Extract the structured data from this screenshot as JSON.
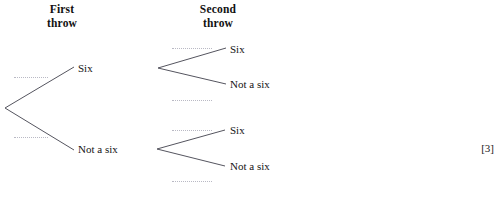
{
  "diagram": {
    "type": "probability-tree",
    "headers": [
      {
        "id": "first",
        "line1": "First",
        "line2": "throw"
      },
      {
        "id": "second",
        "line1": "Second",
        "line2": "throw"
      }
    ],
    "stage_one": {
      "outcomes": [
        {
          "label": "Six",
          "probability_blank": ""
        },
        {
          "label": "Not a six",
          "probability_blank": ""
        }
      ]
    },
    "stage_two": {
      "branch_from_six": {
        "outcomes": [
          {
            "label": "Six",
            "probability_blank": ""
          },
          {
            "label": "Not a six",
            "probability_blank": ""
          }
        ]
      },
      "branch_from_not_a_six": {
        "outcomes": [
          {
            "label": "Six",
            "probability_blank": ""
          },
          {
            "label": "Not a six",
            "probability_blank": ""
          }
        ]
      }
    }
  },
  "marks": "[3]",
  "clipped_footer_text": "",
  "colors": {
    "ink": "#1a1a1a",
    "branch_line": "#55555f",
    "blank_dotted": "#b9b9c4",
    "page_background": "#ffffff"
  }
}
